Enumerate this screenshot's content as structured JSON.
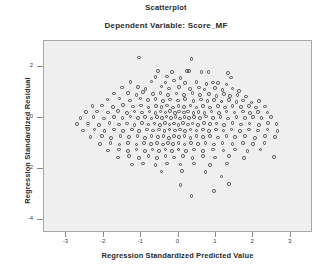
{
  "chart_data": {
    "type": "scatter",
    "title": "Scatterplot",
    "subtitle": "Dependent Variable: Score_MF",
    "xlabel": "Regression Standardized Predicted Value",
    "ylabel": "Regression Standardized Residual",
    "xlim": [
      -3.6,
      3.6
    ],
    "ylim": [
      -4.5,
      3.0
    ],
    "xticks": [
      -3,
      -2,
      -1,
      0,
      1,
      2,
      3
    ],
    "xtick_labels": [
      "-3",
      "-2",
      "-1",
      "0",
      "1",
      "2",
      "3"
    ],
    "yticks": [
      2,
      0,
      -2,
      -4
    ],
    "ytick_labels": [
      "2",
      "0",
      "-2",
      "-4"
    ],
    "grid": false,
    "legend": null,
    "marker": "open-circle",
    "marker_color": "#4a4a4a",
    "plot_background": "#efefef",
    "n_points": 268,
    "points": [
      [
        -1.05,
        2.35
      ],
      [
        0.35,
        2.3
      ],
      [
        -0.55,
        1.82
      ],
      [
        -0.18,
        1.8
      ],
      [
        0.22,
        1.83
      ],
      [
        0.28,
        1.83
      ],
      [
        0.62,
        1.79
      ],
      [
        0.8,
        1.78
      ],
      [
        1.32,
        1.76
      ],
      [
        -0.62,
        1.6
      ],
      [
        -0.3,
        1.62
      ],
      [
        0.05,
        1.55
      ],
      [
        1.4,
        1.58
      ],
      [
        -1.28,
        1.4
      ],
      [
        -0.72,
        1.42
      ],
      [
        -0.35,
        1.38
      ],
      [
        -0.12,
        1.45
      ],
      [
        0.18,
        1.36
      ],
      [
        0.48,
        1.4
      ],
      [
        0.75,
        1.33
      ],
      [
        0.92,
        1.38
      ],
      [
        1.05,
        1.35
      ],
      [
        1.28,
        1.3
      ],
      [
        -1.52,
        1.18
      ],
      [
        -1.08,
        1.2
      ],
      [
        -0.88,
        1.12
      ],
      [
        -0.45,
        1.22
      ],
      [
        -0.25,
        1.15
      ],
      [
        0.02,
        1.2
      ],
      [
        0.3,
        1.12
      ],
      [
        0.55,
        1.18
      ],
      [
        0.7,
        1.1
      ],
      [
        0.98,
        1.16
      ],
      [
        1.18,
        1.08
      ],
      [
        1.45,
        1.14
      ],
      [
        1.62,
        1.05
      ],
      [
        -1.72,
        0.95
      ],
      [
        -1.35,
        0.98
      ],
      [
        -1.12,
        0.9
      ],
      [
        -0.95,
        1.0
      ],
      [
        -0.68,
        0.92
      ],
      [
        -0.48,
        0.98
      ],
      [
        -0.28,
        0.88
      ],
      [
        -0.05,
        0.95
      ],
      [
        0.15,
        0.9
      ],
      [
        0.38,
        0.96
      ],
      [
        0.58,
        0.88
      ],
      [
        0.82,
        0.94
      ],
      [
        1.02,
        0.86
      ],
      [
        1.22,
        0.92
      ],
      [
        1.38,
        0.85
      ],
      [
        1.58,
        0.9
      ],
      [
        1.8,
        0.83
      ],
      [
        -1.9,
        0.72
      ],
      [
        -1.58,
        0.75
      ],
      [
        -1.3,
        0.68
      ],
      [
        -1.02,
        0.76
      ],
      [
        -0.82,
        0.7
      ],
      [
        -0.62,
        0.74
      ],
      [
        -0.42,
        0.66
      ],
      [
        -0.22,
        0.72
      ],
      [
        -0.02,
        0.68
      ],
      [
        0.18,
        0.74
      ],
      [
        0.4,
        0.66
      ],
      [
        0.6,
        0.72
      ],
      [
        0.78,
        0.65
      ],
      [
        0.95,
        0.7
      ],
      [
        1.15,
        0.64
      ],
      [
        1.35,
        0.7
      ],
      [
        1.55,
        0.62
      ],
      [
        1.72,
        0.68
      ],
      [
        1.95,
        0.6
      ],
      [
        2.15,
        0.66
      ],
      [
        -2.3,
        0.45
      ],
      [
        -2.05,
        0.48
      ],
      [
        -1.75,
        0.42
      ],
      [
        -1.48,
        0.5
      ],
      [
        -1.22,
        0.44
      ],
      [
        -1.0,
        0.48
      ],
      [
        -0.8,
        0.4
      ],
      [
        -0.6,
        0.46
      ],
      [
        -0.45,
        0.42
      ],
      [
        -0.3,
        0.48
      ],
      [
        -0.15,
        0.4
      ],
      [
        0.0,
        0.46
      ],
      [
        0.15,
        0.42
      ],
      [
        0.32,
        0.48
      ],
      [
        0.48,
        0.4
      ],
      [
        0.65,
        0.45
      ],
      [
        0.85,
        0.41
      ],
      [
        1.05,
        0.47
      ],
      [
        1.25,
        0.4
      ],
      [
        1.45,
        0.46
      ],
      [
        1.68,
        0.42
      ],
      [
        1.88,
        0.45
      ],
      [
        2.08,
        0.4
      ],
      [
        2.32,
        0.44
      ],
      [
        -2.48,
        0.22
      ],
      [
        -2.18,
        0.25
      ],
      [
        -1.88,
        0.2
      ],
      [
        -1.62,
        0.26
      ],
      [
        -1.38,
        0.18
      ],
      [
        -1.18,
        0.24
      ],
      [
        -0.98,
        0.2
      ],
      [
        -0.78,
        0.25
      ],
      [
        -0.62,
        0.18
      ],
      [
        -0.48,
        0.24
      ],
      [
        -0.35,
        0.2
      ],
      [
        -0.22,
        0.26
      ],
      [
        -0.1,
        0.18
      ],
      [
        0.02,
        0.24
      ],
      [
        0.14,
        0.2
      ],
      [
        0.26,
        0.25
      ],
      [
        0.4,
        0.18
      ],
      [
        0.54,
        0.23
      ],
      [
        0.7,
        0.19
      ],
      [
        0.88,
        0.25
      ],
      [
        1.08,
        0.18
      ],
      [
        1.28,
        0.24
      ],
      [
        1.5,
        0.2
      ],
      [
        1.72,
        0.25
      ],
      [
        1.92,
        0.18
      ],
      [
        2.12,
        0.23
      ],
      [
        2.38,
        0.2
      ],
      [
        -2.62,
        0.0
      ],
      [
        -2.28,
        0.03
      ],
      [
        -2.0,
        -0.02
      ],
      [
        -1.72,
        0.04
      ],
      [
        -1.5,
        -0.01
      ],
      [
        -1.28,
        0.05
      ],
      [
        -1.08,
        0.0
      ],
      [
        -0.9,
        0.04
      ],
      [
        -0.72,
        -0.02
      ],
      [
        -0.58,
        0.03
      ],
      [
        -0.44,
        -0.01
      ],
      [
        -0.32,
        0.05
      ],
      [
        -0.2,
        0.0
      ],
      [
        -0.08,
        0.04
      ],
      [
        0.04,
        -0.02
      ],
      [
        0.16,
        0.03
      ],
      [
        0.28,
        -0.01
      ],
      [
        0.42,
        0.04
      ],
      [
        0.58,
        0.0
      ],
      [
        0.74,
        0.05
      ],
      [
        0.92,
        -0.01
      ],
      [
        1.12,
        0.03
      ],
      [
        1.32,
        -0.02
      ],
      [
        1.55,
        0.04
      ],
      [
        1.78,
        0.0
      ],
      [
        2.0,
        0.03
      ],
      [
        2.22,
        -0.01
      ],
      [
        2.48,
        0.02
      ],
      [
        -2.72,
        -0.25
      ],
      [
        -2.42,
        -0.22
      ],
      [
        -2.12,
        -0.28
      ],
      [
        -1.85,
        -0.2
      ],
      [
        -1.6,
        -0.26
      ],
      [
        -1.38,
        -0.22
      ],
      [
        -1.18,
        -0.28
      ],
      [
        -0.98,
        -0.21
      ],
      [
        -0.8,
        -0.26
      ],
      [
        -0.64,
        -0.22
      ],
      [
        -0.5,
        -0.28
      ],
      [
        -0.36,
        -0.21
      ],
      [
        -0.24,
        -0.26
      ],
      [
        -0.12,
        -0.22
      ],
      [
        0.0,
        -0.28
      ],
      [
        0.12,
        -0.21
      ],
      [
        0.25,
        -0.26
      ],
      [
        0.38,
        -0.22
      ],
      [
        0.52,
        -0.28
      ],
      [
        0.68,
        -0.21
      ],
      [
        0.85,
        -0.25
      ],
      [
        1.02,
        -0.22
      ],
      [
        1.22,
        -0.27
      ],
      [
        1.45,
        -0.21
      ],
      [
        1.68,
        -0.26
      ],
      [
        1.9,
        -0.22
      ],
      [
        2.15,
        -0.27
      ],
      [
        2.4,
        -0.21
      ],
      [
        2.62,
        -0.25
      ],
      [
        -2.55,
        -0.5
      ],
      [
        -2.25,
        -0.46
      ],
      [
        -1.98,
        -0.52
      ],
      [
        -1.72,
        -0.45
      ],
      [
        -1.48,
        -0.51
      ],
      [
        -1.25,
        -0.46
      ],
      [
        -1.05,
        -0.52
      ],
      [
        -0.85,
        -0.45
      ],
      [
        -0.68,
        -0.5
      ],
      [
        -0.52,
        -0.46
      ],
      [
        -0.38,
        -0.52
      ],
      [
        -0.24,
        -0.45
      ],
      [
        -0.1,
        -0.5
      ],
      [
        0.04,
        -0.46
      ],
      [
        0.18,
        -0.52
      ],
      [
        0.32,
        -0.45
      ],
      [
        0.48,
        -0.5
      ],
      [
        0.65,
        -0.46
      ],
      [
        0.82,
        -0.52
      ],
      [
        1.0,
        -0.45
      ],
      [
        1.2,
        -0.5
      ],
      [
        1.42,
        -0.46
      ],
      [
        1.65,
        -0.51
      ],
      [
        1.88,
        -0.45
      ],
      [
        2.12,
        -0.5
      ],
      [
        2.38,
        -0.46
      ],
      [
        2.65,
        -0.52
      ],
      [
        -2.35,
        -0.75
      ],
      [
        -2.05,
        -0.72
      ],
      [
        -1.8,
        -0.78
      ],
      [
        -1.55,
        -0.7
      ],
      [
        -1.32,
        -0.76
      ],
      [
        -1.1,
        -0.72
      ],
      [
        -0.9,
        -0.78
      ],
      [
        -0.72,
        -0.7
      ],
      [
        -0.55,
        -0.75
      ],
      [
        -0.4,
        -0.72
      ],
      [
        -0.26,
        -0.78
      ],
      [
        -0.12,
        -0.7
      ],
      [
        0.02,
        -0.75
      ],
      [
        0.16,
        -0.72
      ],
      [
        0.32,
        -0.78
      ],
      [
        0.48,
        -0.7
      ],
      [
        0.66,
        -0.76
      ],
      [
        0.85,
        -0.72
      ],
      [
        1.05,
        -0.77
      ],
      [
        1.28,
        -0.7
      ],
      [
        1.52,
        -0.75
      ],
      [
        1.78,
        -0.72
      ],
      [
        2.05,
        -0.78
      ],
      [
        2.32,
        -0.7
      ],
      [
        2.58,
        -0.75
      ],
      [
        -2.1,
        -1.02
      ],
      [
        -1.82,
        -0.98
      ],
      [
        -1.58,
        -1.05
      ],
      [
        -1.35,
        -0.98
      ],
      [
        -1.12,
        -1.04
      ],
      [
        -0.92,
        -0.98
      ],
      [
        -0.74,
        -1.03
      ],
      [
        -0.58,
        -0.98
      ],
      [
        -0.42,
        -1.04
      ],
      [
        -0.28,
        -0.98
      ],
      [
        -0.14,
        -1.03
      ],
      [
        0.0,
        -0.98
      ],
      [
        0.16,
        -1.04
      ],
      [
        0.34,
        -0.98
      ],
      [
        0.52,
        -1.02
      ],
      [
        0.72,
        -0.98
      ],
      [
        0.95,
        -1.04
      ],
      [
        1.18,
        -0.98
      ],
      [
        1.45,
        -1.02
      ],
      [
        1.72,
        -0.98
      ],
      [
        2.0,
        -1.03
      ],
      [
        2.3,
        -0.98
      ],
      [
        -1.88,
        -1.28
      ],
      [
        -1.6,
        -1.24
      ],
      [
        -1.35,
        -1.3
      ],
      [
        -1.12,
        -1.24
      ],
      [
        -0.9,
        -1.3
      ],
      [
        -0.7,
        -1.24
      ],
      [
        -0.52,
        -1.29
      ],
      [
        -0.35,
        -1.24
      ],
      [
        -0.18,
        -1.3
      ],
      [
        0.0,
        -1.24
      ],
      [
        0.2,
        -1.29
      ],
      [
        0.42,
        -1.24
      ],
      [
        0.66,
        -1.3
      ],
      [
        0.92,
        -1.24
      ],
      [
        1.2,
        -1.28
      ],
      [
        1.52,
        -1.24
      ],
      [
        1.85,
        -1.29
      ],
      [
        2.2,
        -1.24
      ],
      [
        -1.62,
        -1.55
      ],
      [
        -1.32,
        -1.5
      ],
      [
        -1.05,
        -1.56
      ],
      [
        -0.8,
        -1.5
      ],
      [
        -0.58,
        -1.56
      ],
      [
        -0.35,
        -1.5
      ],
      [
        -0.12,
        -1.55
      ],
      [
        0.12,
        -1.5
      ],
      [
        0.38,
        -1.56
      ],
      [
        0.66,
        -1.5
      ],
      [
        0.98,
        -1.55
      ],
      [
        1.35,
        -1.5
      ],
      [
        1.75,
        -1.56
      ],
      [
        2.55,
        -1.52
      ],
      [
        -1.25,
        -1.82
      ],
      [
        -0.95,
        -1.78
      ],
      [
        -0.62,
        -1.84
      ],
      [
        -0.3,
        -1.78
      ],
      [
        0.05,
        -1.83
      ],
      [
        0.42,
        -1.78
      ],
      [
        0.85,
        -1.84
      ],
      [
        1.3,
        -1.78
      ],
      [
        -0.45,
        -2.1
      ],
      [
        0.1,
        -2.08
      ],
      [
        0.72,
        -2.12
      ],
      [
        1.15,
        -2.3
      ],
      [
        0.05,
        -2.62
      ],
      [
        1.35,
        -2.58
      ],
      [
        0.95,
        -2.85
      ],
      [
        0.35,
        -3.05
      ]
    ]
  }
}
